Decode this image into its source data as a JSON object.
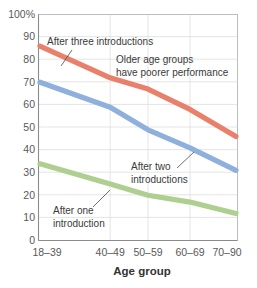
{
  "chart_data": {
    "type": "line",
    "title": "",
    "xlabel": "Age group",
    "ylabel": "",
    "categories": [
      "18–39",
      "40–49",
      "50–59",
      "60–69",
      "70–90"
    ],
    "ylim": [
      0,
      100
    ],
    "yticks": [
      "0",
      "10",
      "20",
      "30",
      "40",
      "50",
      "60",
      "70",
      "80",
      "90",
      "100%"
    ],
    "ytick_values": [
      0,
      10,
      20,
      30,
      40,
      50,
      60,
      70,
      80,
      90,
      100
    ],
    "grid": true,
    "legend": "none",
    "series": [
      {
        "name": "After three introductions",
        "color": "#e8806b",
        "values": [
          86,
          72,
          67,
          58,
          46
        ]
      },
      {
        "name": "After two introductions",
        "color": "#8fb0dc",
        "values": [
          70,
          59,
          49,
          41,
          31
        ]
      },
      {
        "name": "After one introduction",
        "color": "#aecf8f",
        "values": [
          34,
          25,
          20,
          17,
          12
        ]
      }
    ],
    "annotations": [
      {
        "id": "after-three",
        "lines": [
          "After three introductions"
        ],
        "has_leader": true
      },
      {
        "id": "older-age-groups",
        "lines": [
          "Older age groups",
          "have poorer performance"
        ],
        "has_leader": false
      },
      {
        "id": "after-two",
        "lines": [
          "After two",
          "introductions"
        ],
        "has_leader": true
      },
      {
        "id": "after-one",
        "lines": [
          "After one",
          "introduction"
        ],
        "has_leader": true
      }
    ]
  },
  "axis": {
    "y_ticks": {
      "t100": "100%",
      "t90": "90",
      "t80": "80",
      "t70": "70",
      "t60": "60",
      "t50": "50",
      "t40": "40",
      "t30": "30",
      "t20": "20",
      "t10": "10",
      "t0": "0"
    },
    "x_ticks": {
      "c0": "18–39",
      "c1": "40–49",
      "c2": "50–59",
      "c3": "60–69",
      "c4": "70–90"
    },
    "x_title": "Age group"
  },
  "annotations": {
    "after_three": "After three introductions",
    "older_line1": "Older age groups",
    "older_line2": "have poorer performance",
    "after_two_line1": "After two",
    "after_two_line2": "introductions",
    "after_one_line1": "After one",
    "after_one_line2": "introduction"
  },
  "colors": {
    "series_three": "#e8806b",
    "series_two": "#8fb0dc",
    "series_one": "#aecf8f",
    "gridline": "#d9dadb",
    "text": "#58595b"
  }
}
